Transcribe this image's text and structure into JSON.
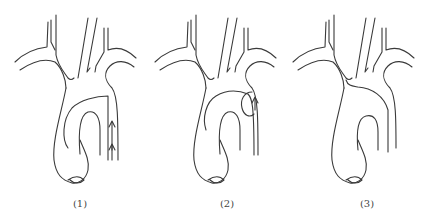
{
  "figure": {
    "line_color": "#3a3a3a",
    "background": "#ffffff",
    "panels": [
      {
        "label": "(1)",
        "center_x": 80,
        "annotation": "two upward arrows in descending segment"
      },
      {
        "label": "(2)",
        "center_x": 227,
        "annotation": "loop with single upward arrow"
      },
      {
        "label": "(3)",
        "center_x": 367,
        "annotation": "plain arch"
      }
    ]
  }
}
